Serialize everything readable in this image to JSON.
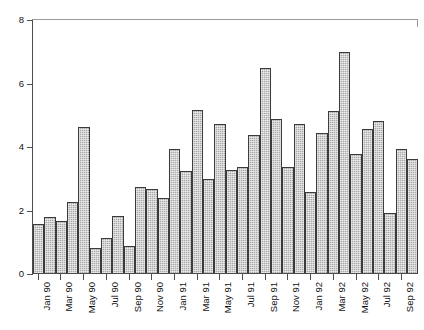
{
  "top_caption": "",
  "chart_data": {
    "type": "bar",
    "title": "",
    "subtitle": "",
    "xlabel": "",
    "ylabel": "",
    "ylim": [
      0,
      8
    ],
    "ytick_labels": [
      "0",
      "2",
      "4",
      "6",
      "8"
    ],
    "ytick_values": [
      0,
      2,
      4,
      6,
      8
    ],
    "grid": false,
    "legend": null,
    "categories": [
      "Jan 90",
      "Feb 90",
      "Mar 90",
      "Apr 90",
      "May 90",
      "Jun 90",
      "Jul 90",
      "Aug 90",
      "Sep 90",
      "Oct 90",
      "Nov 90",
      "Dec 90",
      "Jan 91",
      "Feb 91",
      "Mar 91",
      "Apr 91",
      "May 91",
      "Jun 91",
      "Jul 91",
      "Aug 91",
      "Sep 91",
      "Oct 91",
      "Nov 91",
      "Dec 91",
      "Jan 92",
      "Feb 92",
      "Mar 92",
      "Apr 92",
      "May 92",
      "Jun 92",
      "Jul 92",
      "Aug 92",
      "Sep 92"
    ],
    "xtick_labels": [
      "Jan 90",
      "Mar 90",
      "May 90",
      "Jul 90",
      "Sep 90",
      "Nov 90",
      "Jan 91",
      "Mar 91",
      "May 91",
      "Jul 91",
      "Sep 91",
      "Nov 91",
      "Jan 92",
      "Mar 92",
      "May 92",
      "Jul 92",
      "Sep 92"
    ],
    "xtick_indices": [
      0,
      2,
      4,
      6,
      8,
      10,
      12,
      14,
      16,
      18,
      20,
      22,
      24,
      26,
      28,
      30,
      32
    ],
    "values": [
      1.55,
      1.75,
      1.65,
      2.25,
      4.6,
      0.8,
      1.1,
      1.8,
      0.85,
      2.7,
      2.65,
      2.35,
      3.9,
      3.2,
      5.15,
      2.95,
      4.7,
      3.25,
      3.35,
      4.35,
      6.45,
      4.85,
      3.35,
      4.7,
      2.55,
      4.4,
      5.1,
      6.95,
      3.75,
      4.55,
      4.8,
      1.9,
      3.9
    ],
    "extra_value": 3.6,
    "bar_fill": "#a9a9a9",
    "bar_border": "#3b3b3b",
    "axis_color": "#4d4d4d"
  }
}
